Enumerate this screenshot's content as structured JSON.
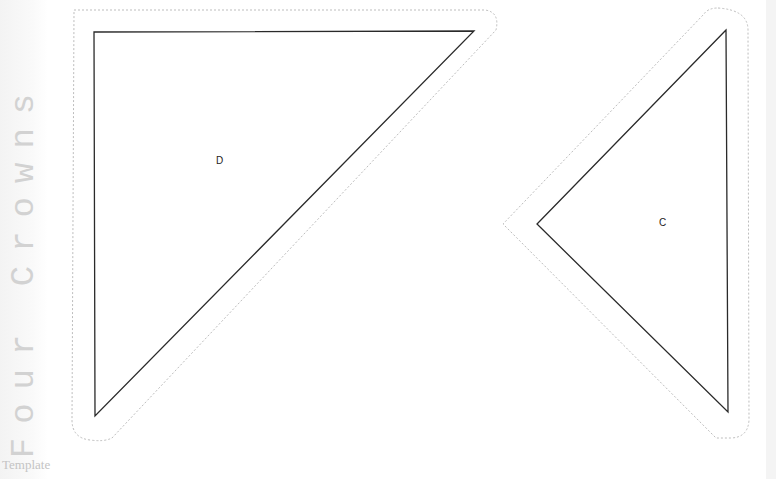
{
  "brand": {
    "title": "Four Crowns",
    "subtitle": "Template"
  },
  "pieces": [
    {
      "label": "D",
      "shape": "right-triangle",
      "outline_color": "#222222",
      "seam_color": "#bbbbbb"
    },
    {
      "label": "C",
      "shape": "triangle",
      "outline_color": "#222222",
      "seam_color": "#bbbbbb"
    }
  ]
}
